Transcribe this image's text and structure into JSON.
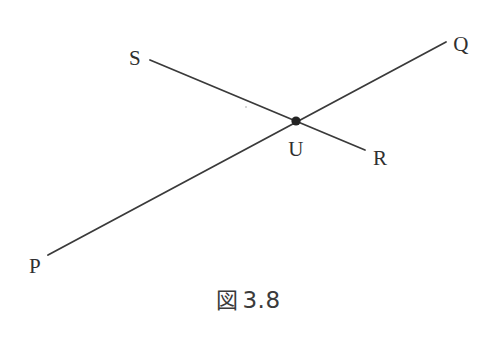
{
  "figure": {
    "caption_kanji": "図",
    "caption_number": "3.8",
    "caption_full": "図 3.8",
    "background_color": "#ffffff",
    "stroke_color": "#3a3a3a",
    "label_color": "#2f2f2f",
    "width": 497,
    "height": 341
  },
  "chart_data": {
    "type": "diagram",
    "subtype": "intersecting-lines",
    "points": [
      {
        "name": "P",
        "x": 48,
        "y": 255,
        "label_x": 35,
        "label_y": 266,
        "is_endpoint": true,
        "marked": false
      },
      {
        "name": "Q",
        "x": 446,
        "y": 42,
        "label_x": 461,
        "label_y": 44,
        "is_endpoint": true,
        "marked": false
      },
      {
        "name": "S",
        "x": 150,
        "y": 60,
        "label_x": 135,
        "label_y": 58,
        "is_endpoint": true,
        "marked": false
      },
      {
        "name": "R",
        "x": 365,
        "y": 150,
        "label_x": 380,
        "label_y": 158,
        "is_endpoint": true,
        "marked": false
      },
      {
        "name": "U",
        "x": 296,
        "y": 121,
        "label_x": 296,
        "label_y": 149,
        "is_endpoint": false,
        "marked": true
      }
    ],
    "segments": [
      {
        "name": "line-PQ",
        "from": "P",
        "to": "Q",
        "x1": 48,
        "y1": 255,
        "x2": 446,
        "y2": 42,
        "stroke_width": 1.8
      },
      {
        "name": "line-SR",
        "from": "S",
        "to": "R",
        "x1": 150,
        "y1": 60,
        "x2": 365,
        "y2": 150,
        "stroke_width": 1.8
      }
    ],
    "intersection": {
      "name": "U",
      "x": 296,
      "y": 121,
      "dot_radius": 4.6
    },
    "artifacts": [
      {
        "name": "scan-speck",
        "x": 245,
        "y": 106
      }
    ]
  }
}
